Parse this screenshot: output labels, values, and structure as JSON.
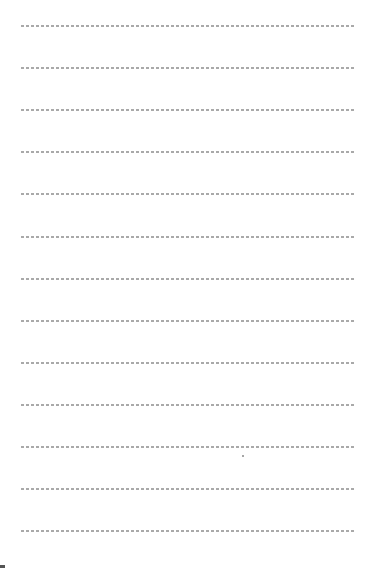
{
  "document": {
    "type": "lined-paper",
    "rule_style": "dashed",
    "rule_color": "#9a9a9a",
    "background": "#ffffff",
    "rule_count": 13,
    "rule_positions_y": [
      25,
      67,
      109,
      151,
      193,
      236,
      278,
      320,
      362,
      404,
      446,
      488,
      530
    ],
    "caption": ""
  }
}
